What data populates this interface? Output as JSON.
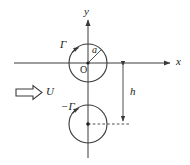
{
  "figure": {
    "colors": {
      "stroke": "#3a3a3a",
      "text": "#1a1a1a",
      "background": "#ffffff"
    },
    "axes": {
      "x_label": "x",
      "y_label": "y",
      "origin_label": "O"
    },
    "labels": {
      "radius": "a",
      "circulation_top": "Γ",
      "circulation_bottom": "−Γ",
      "distance": "h",
      "freestream": "U"
    },
    "geometry": {
      "origin": {
        "x": 88,
        "y": 63
      },
      "circle_radius": 19,
      "top_circle_center": {
        "x": 88,
        "y": 63
      },
      "bottom_circle_center": {
        "x": 88,
        "y": 124
      },
      "x_axis": {
        "x1": 14,
        "x2": 172,
        "y": 63
      },
      "y_axis": {
        "x": 88,
        "y1": 18,
        "y2": 158
      },
      "h_dimension_line": {
        "x": 123,
        "y1": 63,
        "y2": 124
      }
    }
  }
}
